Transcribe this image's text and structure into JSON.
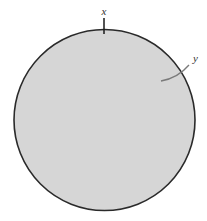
{
  "diagram": {
    "shape": "circle",
    "circle": {
      "cx": 104.5,
      "cy": 120,
      "r": 90.5,
      "fill": "#d6d6d6",
      "stroke": "#2a2a2a",
      "stroke_width": 1.6
    },
    "labels": {
      "x": "x",
      "y": "y"
    },
    "tick_x": {
      "x": 104,
      "y1": 18,
      "y2": 34,
      "color": "#1a1a1a"
    },
    "leader_y": {
      "path": "M161 81 Q178 78 189 65",
      "color": "#7a7a7a"
    }
  }
}
